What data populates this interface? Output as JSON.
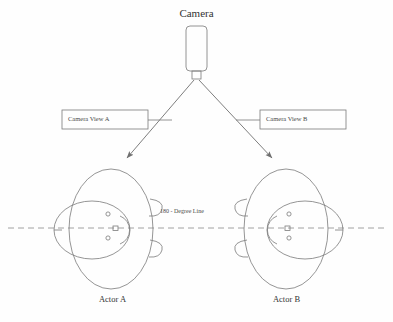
{
  "diagram": {
    "title": "Camera",
    "camera": {
      "label": "Camera",
      "body_name": "camera-body",
      "lens_name": "camera-lens"
    },
    "view_boxes": [
      {
        "label": "Camera View A",
        "side": "left"
      },
      {
        "label": "Camera View B",
        "side": "right"
      }
    ],
    "axis": {
      "label": "180 - Degree Line",
      "style": "dashed"
    },
    "actors": [
      {
        "label": "Actor A",
        "side": "left"
      },
      {
        "label": "Actor B",
        "side": "right"
      }
    ],
    "arrows": [
      {
        "name": "camera-to-actor-a-arrow",
        "direction": "down-left"
      },
      {
        "name": "camera-to-actor-b-arrow",
        "direction": "down-right"
      }
    ],
    "colors": {
      "stroke": "#7a7a7a",
      "text": "#3b3b3b",
      "background": "#fefefe"
    }
  }
}
